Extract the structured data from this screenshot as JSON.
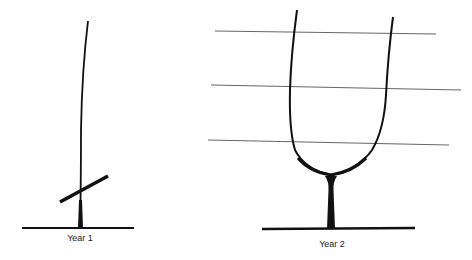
{
  "diagram": {
    "panels": [
      {
        "label": "Year 1",
        "description": "single vine cane tied to stake with cross tie above ground"
      },
      {
        "label": "Year 2",
        "description": "trunk splitting into two arms trained along three horizontal wires"
      }
    ],
    "colors": {
      "ink": "#111111",
      "wire": "#555555",
      "background": "#ffffff"
    }
  }
}
